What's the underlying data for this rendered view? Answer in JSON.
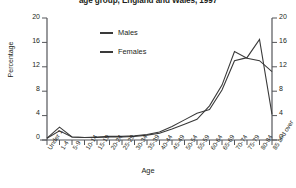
{
  "chart_data": {
    "type": "line",
    "title": "age group, England and Wales, 1997",
    "xlabel": "Age",
    "ylabel": "Percentage",
    "ylim": [
      0,
      20
    ],
    "yticks": [
      0,
      4,
      8,
      12,
      16,
      20
    ],
    "grid": false,
    "legend_position": "upper-left-inside",
    "categories": [
      "Under 1",
      "1-4",
      "5-9",
      "10-14",
      "15-19",
      "20-24",
      "25-29",
      "30-34",
      "35-39",
      "40-44",
      "45-49",
      "50-54",
      "55-59",
      "60-64",
      "65-69",
      "70-74",
      "75-79",
      "80-84",
      "85 and over"
    ],
    "series": [
      {
        "name": "Males",
        "color": "#3a3a3a",
        "values": [
          0.3,
          2.1,
          0.5,
          0.4,
          0.5,
          0.6,
          0.6,
          0.7,
          0.9,
          1.3,
          2.2,
          3.3,
          4.4,
          5.0,
          8.2,
          13.0,
          13.5,
          16.5,
          4.2
        ]
      },
      {
        "name": "Females",
        "color": "#3a3a3a",
        "values": [
          0.3,
          1.5,
          0.5,
          0.4,
          0.4,
          0.5,
          0.5,
          0.6,
          0.8,
          1.1,
          1.8,
          2.6,
          3.4,
          5.6,
          9.0,
          14.5,
          13.4,
          13.0,
          11.2
        ]
      }
    ]
  },
  "legend": {
    "items": [
      {
        "label": "Males"
      },
      {
        "label": "Females"
      }
    ]
  },
  "axes": {
    "left_ticks": [
      "20",
      "16",
      "12",
      "8",
      "4",
      "0"
    ],
    "right_ticks": [
      "20",
      "16",
      "12",
      "8",
      "4",
      "0"
    ]
  }
}
